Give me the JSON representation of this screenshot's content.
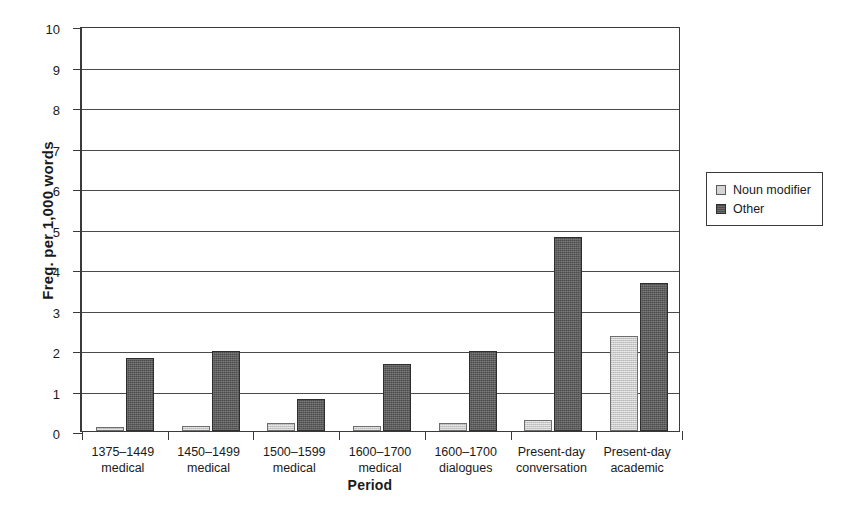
{
  "chart_data": {
    "type": "bar",
    "title": "",
    "xlabel": "Period",
    "ylabel": "Freq. per 1,000 words",
    "ylim": [
      0,
      10
    ],
    "yticks": [
      0,
      1,
      2,
      3,
      4,
      5,
      6,
      7,
      8,
      9,
      10
    ],
    "grid": true,
    "legend_position": "right",
    "categories": [
      "1375–1449 medical",
      "1450–1499 medical",
      "1500–1599 medical",
      "1600–1700 medical",
      "1600–1700 dialogues",
      "Present-day conversation",
      "Present-day academic"
    ],
    "category_lines": [
      [
        "1375–1449",
        "medical"
      ],
      [
        "1450–1499",
        "medical"
      ],
      [
        "1500–1599",
        "medical"
      ],
      [
        "1600–1700",
        "medical"
      ],
      [
        "1600–1700",
        "dialogues"
      ],
      [
        "Present-day",
        "conversation"
      ],
      [
        "Present-day",
        "academic"
      ]
    ],
    "series": [
      {
        "name": "Noun modifier",
        "color": "#c9c9c9",
        "values": [
          0.1,
          0.12,
          0.2,
          0.12,
          0.2,
          0.27,
          2.35
        ]
      },
      {
        "name": "Other",
        "color": "#4c4c4c",
        "values": [
          1.8,
          1.97,
          0.79,
          1.65,
          1.98,
          4.8,
          3.66
        ]
      }
    ]
  },
  "legend": {
    "entries": [
      {
        "label": "Noun modifier"
      },
      {
        "label": "Other"
      }
    ]
  }
}
